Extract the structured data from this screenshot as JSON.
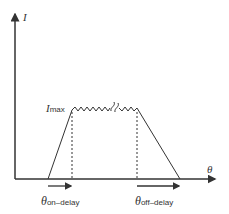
{
  "diagram": {
    "y_axis_label": "I",
    "x_axis_label": "θ",
    "peak_label": {
      "symbol": "I",
      "subscript": "max"
    },
    "on_delay_label": {
      "symbol": "θ",
      "subscript": "on–delay"
    },
    "off_delay_label": {
      "symbol": "θ",
      "subscript": "off–delay"
    },
    "colors": {
      "line": "#333333",
      "background": "#ffffff"
    }
  }
}
